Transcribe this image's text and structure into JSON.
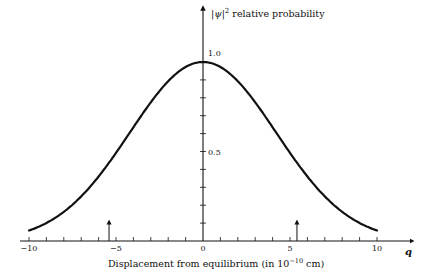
{
  "chart_data": {
    "type": "line",
    "title": "",
    "ylabel": "|ψ|² relative probability",
    "ylabel_parts": {
      "psi": "ψ",
      "sup": "2",
      "text": "relative probability"
    },
    "xlabel": "Displacement from equilibrium (in 10⁻¹⁰ cm)",
    "xlabel_parts": {
      "pre": "Displacement from equilibrium (in 10",
      "sup": "−10",
      "post": " cm)"
    },
    "x_axis_symbol": "q",
    "xlim": [
      -10,
      10
    ],
    "ylim": [
      0,
      1.0
    ],
    "x_ticks": [
      -10,
      -9,
      -8,
      -7,
      -6,
      -5,
      -4,
      -3,
      -2,
      -1,
      0,
      1,
      2,
      3,
      4,
      5,
      6,
      7,
      8,
      9,
      10
    ],
    "x_tick_labels": [
      {
        "value": -10,
        "label": "−10"
      },
      {
        "value": -5,
        "label": "−5"
      },
      {
        "value": 0,
        "label": "0"
      },
      {
        "value": 5,
        "label": "5"
      },
      {
        "value": 10,
        "label": "10"
      }
    ],
    "y_ticks": [
      0.1,
      0.2,
      0.3,
      0.4,
      0.5,
      0.6,
      0.7,
      0.8,
      0.9,
      1.0
    ],
    "y_tick_labels": [
      {
        "value": 0.5,
        "label": "0.5"
      },
      {
        "value": 1.0,
        "label": "1.0"
      }
    ],
    "grid": false,
    "legend": null,
    "series": [
      {
        "name": "|ψ|² (ground state, Gaussian)",
        "x": [
          -10,
          -9,
          -8,
          -7,
          -6,
          -5,
          -4,
          -3,
          -2,
          -1,
          0,
          1,
          2,
          3,
          4,
          5,
          6,
          7,
          8,
          9,
          10
        ],
        "values": [
          0.04,
          0.08,
          0.14,
          0.23,
          0.35,
          0.5,
          0.64,
          0.78,
          0.9,
          0.97,
          1.0,
          0.97,
          0.9,
          0.78,
          0.64,
          0.5,
          0.35,
          0.23,
          0.14,
          0.08,
          0.04
        ]
      }
    ],
    "annotations": [
      {
        "type": "arrow",
        "x": -5.4,
        "label": "classical turning point"
      },
      {
        "type": "arrow",
        "x": 5.4,
        "label": "classical turning point"
      }
    ],
    "gaussian_sigma": 4.2
  }
}
